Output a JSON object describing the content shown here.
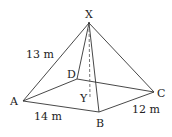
{
  "diagram": {
    "type": "square-based pyramid",
    "vertices": {
      "apex": "X",
      "base": [
        "A",
        "B",
        "C",
        "D"
      ],
      "foot": "Y"
    },
    "labels": {
      "X": "X",
      "A": "A",
      "B": "B",
      "C": "C",
      "D": "D",
      "Y": "Y",
      "edge_XA": "13 m",
      "edge_AB": "14 m",
      "edge_BC": "12 m"
    }
  }
}
